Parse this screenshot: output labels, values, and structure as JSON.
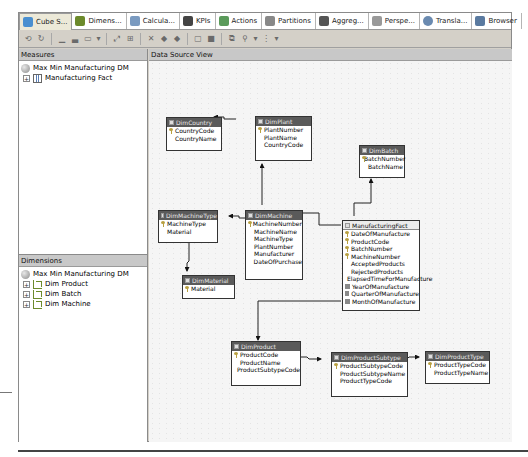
{
  "tabs": [
    {
      "label": "Cube S...",
      "icon": "cube-structure-icon",
      "color": "#4a8fd0",
      "active": true
    },
    {
      "label": "Dimens...",
      "icon": "dimension-usage-icon",
      "color": "#6c8a2b",
      "active": false
    },
    {
      "label": "Calcula...",
      "icon": "calculations-icon",
      "color": "#7a9ac0",
      "active": false
    },
    {
      "label": "KPIs",
      "icon": "kpis-icon",
      "color": "#444444",
      "active": false
    },
    {
      "label": "Actions",
      "icon": "actions-icon",
      "color": "#5a9a5a",
      "active": false
    },
    {
      "label": "Partitions",
      "icon": "partitions-icon",
      "color": "#888888",
      "active": false
    },
    {
      "label": "Aggreg...",
      "icon": "aggregations-icon",
      "color": "#555555",
      "active": false
    },
    {
      "label": "Perspe...",
      "icon": "perspectives-icon",
      "color": "#999999",
      "active": false
    },
    {
      "label": "Transla...",
      "icon": "translations-icon",
      "color": "#6a8ab0",
      "active": false
    },
    {
      "label": "Browser",
      "icon": "browser-icon",
      "color": "#5a7aa0",
      "active": false
    }
  ],
  "toolbar": {
    "buttons": [
      "process-icon",
      "refresh-icon",
      "sep",
      "new-measure-icon",
      "new-measure-group-icon",
      "show-measure-grid-icon",
      "dropdown-icon",
      "sep",
      "new-linked-object-icon",
      "add-cube-dimension-icon",
      "sep",
      "delete-icon",
      "move-up-icon",
      "move-down-icon",
      "sep",
      "show-table-icon",
      "hide-table-icon",
      "sep",
      "arrange-icon",
      "zoom-icon",
      "dropdown-icon",
      "diagram-layout-icon",
      "dropdown-icon"
    ]
  },
  "measures": {
    "header": "Measures",
    "cube": "Max Min Manufacturing DM",
    "items": [
      {
        "label": "Manufacturing Fact",
        "expander": "+"
      }
    ]
  },
  "dimensions": {
    "header": "Dimensions",
    "cube": "Max Min Manufacturing DM",
    "items": [
      {
        "label": "Dim Product",
        "expander": "+"
      },
      {
        "label": "Dim Batch",
        "expander": "+"
      },
      {
        "label": "Dim Machine",
        "expander": "+"
      }
    ]
  },
  "dsv": {
    "header": "Data Source View",
    "tables": {
      "DimCountry": {
        "title": "DimCountry",
        "columns": [
          {
            "name": "CountryCode",
            "key": true
          },
          {
            "name": "CountryName",
            "key": false
          }
        ]
      },
      "DimPlant": {
        "title": "DimPlant",
        "columns": [
          {
            "name": "PlantNumber",
            "key": true
          },
          {
            "name": "PlantName",
            "key": false
          },
          {
            "name": "CountryCode",
            "key": false
          }
        ]
      },
      "DimBatch": {
        "title": "DimBatch",
        "columns": [
          {
            "name": "BatchNumber",
            "key": true
          },
          {
            "name": "BatchName",
            "key": false
          }
        ]
      },
      "DimMachineType": {
        "title": "DimMachineType",
        "columns": [
          {
            "name": "MachineType",
            "key": true
          },
          {
            "name": "Material",
            "key": false
          }
        ]
      },
      "DimMachine": {
        "title": "DimMachine",
        "columns": [
          {
            "name": "MachineNumber",
            "key": true
          },
          {
            "name": "MachineName",
            "key": false
          },
          {
            "name": "MachineType",
            "key": false
          },
          {
            "name": "PlantNumber",
            "key": false
          },
          {
            "name": "Manufacturer",
            "key": false
          },
          {
            "name": "DateOfPurchase",
            "key": false
          }
        ]
      },
      "DimMaterial": {
        "title": "DimMaterial",
        "columns": [
          {
            "name": "Material",
            "key": true
          }
        ]
      },
      "ManufacturingFact": {
        "title": "ManufacturingFact",
        "columns": [
          {
            "name": "DateOfManufacture",
            "key": true
          },
          {
            "name": "ProductCode",
            "key": true
          },
          {
            "name": "BatchNumber",
            "key": true
          },
          {
            "name": "MachineNumber",
            "key": true
          },
          {
            "name": "AcceptedProducts",
            "key": false
          },
          {
            "name": "RejectedProducts",
            "key": false
          },
          {
            "name": "ElapsedTimeForManufacture",
            "key": false
          },
          {
            "name": "YearOfManufacture",
            "calc": true
          },
          {
            "name": "QuarterOfManufacture",
            "calc": true
          },
          {
            "name": "MonthOfManufacture",
            "calc": true
          }
        ]
      },
      "DimProduct": {
        "title": "DimProduct",
        "columns": [
          {
            "name": "ProductCode",
            "key": true
          },
          {
            "name": "ProductName",
            "key": false
          },
          {
            "name": "ProductSubtypeCode",
            "key": false
          }
        ]
      },
      "DimProductSubtype": {
        "title": "DimProductSubtype",
        "columns": [
          {
            "name": "ProductSubtypeCode",
            "key": true
          },
          {
            "name": "ProductSubtypeName",
            "key": false
          },
          {
            "name": "ProductTypeCode",
            "key": false
          }
        ]
      },
      "DimProductType": {
        "title": "DimProductType",
        "columns": [
          {
            "name": "ProductTypeCode",
            "key": true
          },
          {
            "name": "ProductTypeName",
            "key": false
          }
        ]
      }
    }
  }
}
